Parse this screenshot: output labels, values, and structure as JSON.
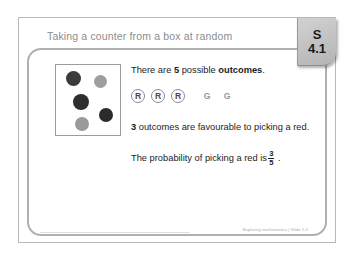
{
  "slide": {
    "title": "Taking a counter from a box at random",
    "tab": {
      "line1": "S",
      "line2": "4.1"
    },
    "footer": "Exploring mathematics | Slide 1.4"
  },
  "counter_box": {
    "label": "box-of-counters",
    "counters": [
      {
        "name": "counter-red-1",
        "color_name": "red",
        "color": "#3b3b3b",
        "x": 10,
        "y": 6,
        "size": 15
      },
      {
        "name": "counter-green-1",
        "color_name": "green",
        "color": "#9e9e9e",
        "x": 38,
        "y": 10,
        "size": 13
      },
      {
        "name": "counter-red-2",
        "color_name": "red",
        "color": "#2e2e2e",
        "x": 17,
        "y": 29,
        "size": 16
      },
      {
        "name": "counter-red-3",
        "color_name": "red",
        "color": "#2b2b2b",
        "x": 43,
        "y": 43,
        "size": 14
      },
      {
        "name": "counter-green-2",
        "color_name": "green",
        "color": "#9a9a9a",
        "x": 19,
        "y": 52,
        "size": 14
      }
    ]
  },
  "body": {
    "line_outcomes": {
      "pre": "There are ",
      "count": "5",
      "mid": " possible ",
      "keyword": "outcomes",
      "post": "."
    },
    "symbols": [
      {
        "name": "symbol-r-1",
        "label": "R",
        "kind": "red"
      },
      {
        "name": "symbol-r-2",
        "label": "R",
        "kind": "red"
      },
      {
        "name": "symbol-r-3",
        "label": "R",
        "kind": "red"
      },
      {
        "name": "symbol-g-1",
        "label": "G",
        "kind": "green"
      },
      {
        "name": "symbol-g-2",
        "label": "G",
        "kind": "green"
      }
    ],
    "line_favourable": {
      "count": "3",
      "rest": " outcomes are favourable to picking a red."
    },
    "line_probability": {
      "text": "The probability of picking a red is",
      "numerator": "3",
      "denominator": "5",
      "period": "."
    }
  },
  "colors": {
    "title_gray": "#8d8d8d",
    "text_black": "#1d1d1d",
    "tab_gray": "#c4c4c4",
    "panel_border": "#b0b0b0",
    "red_counter": "#3b3b3b",
    "green_counter": "#9e9e9e"
  }
}
